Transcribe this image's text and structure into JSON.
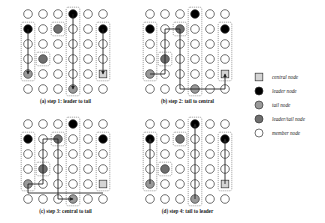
{
  "figure": {
    "panels": [
      {
        "id": "a",
        "caption": "(a) step 1: leader to tail",
        "origin": [
          28,
          14
        ],
        "nodes": {
          "leader": [
            [
              3,
              0
            ],
            [
              0,
              1
            ],
            [
              5,
              1
            ]
          ],
          "tail": [
            [
              0,
              4
            ],
            [
              3,
              5
            ]
          ],
          "leader_tail": [
            [
              2,
              1
            ],
            [
              1,
              3
            ]
          ],
          "central": [
            [
              5,
              4
            ]
          ]
        },
        "boxes": [
          [
            0,
            1,
            0,
            4
          ],
          [
            3,
            0,
            3,
            5
          ],
          [
            5,
            1,
            5,
            4
          ],
          [
            2,
            1,
            2,
            1
          ],
          [
            1,
            3,
            1,
            3
          ]
        ],
        "paths": [
          [
            [
              0,
              1
            ],
            [
              0,
              4
            ]
          ],
          [
            [
              3,
              0
            ],
            [
              3,
              5
            ]
          ],
          [
            [
              5,
              1
            ],
            [
              5,
              4
            ]
          ]
        ]
      },
      {
        "id": "b",
        "caption": "(b) step 2: tail to central",
        "origin": [
          150,
          14
        ],
        "nodes": {
          "leader": [
            [
              3,
              0
            ],
            [
              0,
              1
            ],
            [
              5,
              1
            ]
          ],
          "tail": [
            [
              0,
              4
            ],
            [
              3,
              5
            ]
          ],
          "leader_tail": [
            [
              2,
              1
            ],
            [
              1,
              3
            ]
          ],
          "central": [
            [
              5,
              4
            ]
          ]
        },
        "boxes": [
          [
            0,
            1,
            0,
            4
          ],
          [
            3,
            0,
            3,
            5
          ],
          [
            5,
            1,
            5,
            4
          ],
          [
            2,
            1,
            2,
            1
          ],
          [
            1,
            3,
            1,
            3
          ]
        ],
        "paths": [
          [
            [
              0,
              4
            ],
            [
              1,
              4
            ],
            [
              1,
              1
            ],
            [
              2,
              1
            ],
            [
              2,
              5
            ],
            [
              5,
              5
            ],
            [
              5,
              4
            ]
          ]
        ]
      },
      {
        "id": "c",
        "caption": "(c) step 3: central to tail",
        "origin": [
          28,
          124
        ],
        "nodes": {
          "leader": [
            [
              3,
              0
            ],
            [
              0,
              1
            ],
            [
              5,
              1
            ]
          ],
          "tail": [
            [
              0,
              4
            ],
            [
              3,
              5
            ]
          ],
          "leader_tail": [
            [
              2,
              1
            ],
            [
              1,
              3
            ]
          ],
          "central": [
            [
              5,
              4
            ]
          ]
        },
        "boxes": [
          [
            0,
            1,
            0,
            4
          ],
          [
            3,
            0,
            3,
            5
          ],
          [
            5,
            1,
            5,
            4
          ],
          [
            2,
            1,
            2,
            1
          ],
          [
            1,
            3,
            1,
            3
          ]
        ],
        "paths": [
          [
            [
              5,
              4.6
            ],
            [
              0,
              4.6
            ],
            [
              0,
              4
            ],
            [
              1,
              4
            ],
            [
              1,
              1
            ],
            [
              2,
              1
            ],
            [
              2,
              5
            ],
            [
              3,
              5
            ]
          ]
        ]
      },
      {
        "id": "d",
        "caption": "(d) step 4: tail to leader",
        "origin": [
          150,
          124
        ],
        "nodes": {
          "leader": [
            [
              3,
              0
            ],
            [
              0,
              1
            ],
            [
              5,
              1
            ]
          ],
          "tail": [
            [
              0,
              4
            ],
            [
              3,
              5
            ]
          ],
          "leader_tail": [
            [
              2,
              1
            ],
            [
              1,
              3
            ]
          ],
          "central": [
            [
              5,
              4
            ]
          ]
        },
        "boxes": [
          [
            0,
            1,
            0,
            4
          ],
          [
            3,
            0,
            3,
            5
          ],
          [
            5,
            1,
            5,
            4
          ],
          [
            2,
            1,
            2,
            1
          ],
          [
            1,
            3,
            1,
            3
          ]
        ],
        "paths": [
          [
            [
              0,
              4
            ],
            [
              0,
              1
            ]
          ],
          [
            [
              3,
              5
            ],
            [
              3,
              0
            ]
          ],
          [
            [
              5,
              4
            ],
            [
              5,
              1
            ]
          ]
        ]
      }
    ],
    "grid": {
      "cols": 6,
      "rows": 6,
      "spacing": 15,
      "radius": 4.3
    },
    "legend": [
      {
        "type": "central",
        "label": "central node"
      },
      {
        "type": "leader",
        "label": "leader node"
      },
      {
        "type": "tail",
        "label": "tail node"
      },
      {
        "type": "leader_tail",
        "label": "leader/tail node"
      },
      {
        "type": "member",
        "label": "member node"
      }
    ],
    "colors": {
      "leader": "#000000",
      "tail": "#9a9a9a",
      "leader_tail": "#6e6e6e",
      "central": "#d4d4d4",
      "member": "#ffffff",
      "stroke": "#333333"
    }
  }
}
